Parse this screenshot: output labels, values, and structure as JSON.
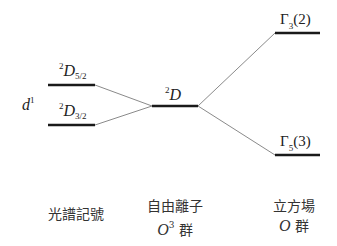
{
  "diagram": {
    "left_label": {
      "base": "d",
      "sup": "1"
    },
    "levels": {
      "d52": {
        "sup": "2",
        "letter": "D",
        "frac": "5/2"
      },
      "d32": {
        "sup": "2",
        "letter": "D",
        "frac": "3/2"
      },
      "free_ion": {
        "sup": "2",
        "letter": "D"
      },
      "gamma3": {
        "symbol": "Γ",
        "sub": "3",
        "deg": "(2)"
      },
      "gamma5": {
        "symbol": "Γ",
        "sub": "5",
        "deg": "(3)"
      }
    },
    "columns": [
      {
        "line1": "光譜記號",
        "line2": ""
      },
      {
        "line1": "自由離子",
        "line2_italic": "O",
        "line2_sup": "3",
        "line2_rest": " 群"
      },
      {
        "line1": "立方場",
        "line2_italic": "O",
        "line2_rest": " 群"
      }
    ],
    "colors": {
      "level": "#1a1a1a",
      "connector": "#8a8a8a"
    }
  }
}
